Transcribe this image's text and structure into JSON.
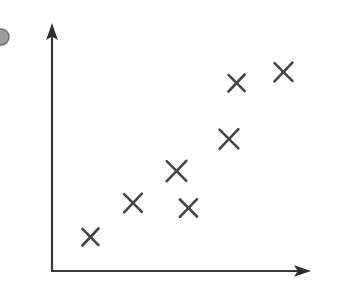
{
  "figure": {
    "kind": "scatter-plot-sketch",
    "width": 346,
    "height": 291,
    "background_color": "#ffffff",
    "axis_color": "#3a3a3a",
    "marker_color": "#454545",
    "marker_glyph": "x",
    "title": "",
    "caption": ""
  },
  "axes": {
    "y_axis": {
      "label": "",
      "origin_x": 52,
      "bottom_y": 271,
      "top_y": 28,
      "has_arrowhead": true,
      "tick_labels": []
    },
    "x_axis": {
      "label": "",
      "origin_y": 271,
      "left_x": 52,
      "right_x": 307,
      "has_arrowhead": true,
      "tick_labels": []
    }
  },
  "edge_marker": {
    "name": "partial-circle-clipped",
    "cx": 1,
    "cy": 37,
    "r": 8,
    "color": "#8a8a8a"
  },
  "chart_data": {
    "type": "scatter",
    "title": "",
    "subtitle": "",
    "xlabel": "",
    "ylabel": "",
    "xlim": [
      0,
      10
    ],
    "ylim": [
      0,
      10
    ],
    "grid": false,
    "legend": null,
    "annotations": [],
    "marker": "x",
    "series": [
      {
        "name": "observations",
        "color": "#454545",
        "points": [
          {
            "px": 91,
            "py": 237,
            "x": 1.5,
            "y": 1.4
          },
          {
            "px": 133,
            "py": 203,
            "x": 3.2,
            "y": 2.8
          },
          {
            "px": 176,
            "py": 171,
            "x": 4.9,
            "y": 4.1
          },
          {
            "px": 189,
            "py": 208,
            "x": 5.4,
            "y": 2.6
          },
          {
            "px": 229,
            "py": 139,
            "x": 7.0,
            "y": 5.4
          },
          {
            "px": 236,
            "py": 83,
            "x": 7.3,
            "y": 7.7
          },
          {
            "px": 284,
            "py": 72,
            "x": 9.2,
            "y": 8.2
          }
        ]
      }
    ],
    "x": [
      1.5,
      3.2,
      4.9,
      5.4,
      7.0,
      7.3,
      9.2
    ],
    "y": [
      1.4,
      2.8,
      4.1,
      2.6,
      5.4,
      7.7,
      8.2
    ],
    "point_count": 7,
    "trend": "positive correlation"
  }
}
